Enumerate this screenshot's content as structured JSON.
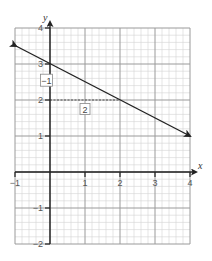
{
  "chart_data": {
    "type": "line",
    "title": "",
    "xlabel": "x",
    "ylabel": "y",
    "xlim": [
      -1,
      4
    ],
    "ylim": [
      -2,
      4
    ],
    "grid": true,
    "grid_minor_divisions": 5,
    "x_ticks": [
      -1,
      1,
      2,
      3,
      4
    ],
    "y_ticks": [
      4,
      3,
      2,
      1,
      -1,
      -2
    ],
    "x_tick_labels": [
      "-1",
      "1",
      "2",
      "3",
      "4"
    ],
    "y_tick_labels": [
      "4",
      "3",
      "2",
      "1",
      "-1",
      "-2"
    ],
    "series": [
      {
        "name": "line",
        "points": [
          [
            -1,
            3.5
          ],
          [
            0,
            3
          ],
          [
            2,
            2
          ],
          [
            4,
            1
          ]
        ],
        "slope": -0.5,
        "y_intercept": 3,
        "arrows": "both",
        "color": "#222222"
      }
    ],
    "annotations": [
      {
        "type": "dashed_segment",
        "from": [
          0,
          2
        ],
        "to": [
          2,
          2
        ],
        "description": "run from y-intercept level"
      },
      {
        "type": "boxed_label",
        "text": "-1",
        "position": [
          -0.1,
          2.55
        ],
        "meaning": "rise"
      },
      {
        "type": "boxed_label",
        "text": "2",
        "position": [
          1.0,
          1.75
        ],
        "meaning": "run"
      }
    ]
  },
  "axes": {
    "x_name": "x",
    "y_name": "y"
  },
  "labels": {
    "x_ticks": [
      {
        "value": -1,
        "text": "−1"
      },
      {
        "value": 1,
        "text": "1"
      },
      {
        "value": 2,
        "text": "2"
      },
      {
        "value": 3,
        "text": "3"
      },
      {
        "value": 4,
        "text": "4"
      }
    ],
    "y_ticks": [
      {
        "value": 4,
        "text": "4"
      },
      {
        "value": 3,
        "text": "3"
      },
      {
        "value": 2,
        "text": "2"
      },
      {
        "value": 1,
        "text": "1"
      },
      {
        "value": -1,
        "text": "−1"
      },
      {
        "value": -2,
        "text": "−2"
      }
    ],
    "rise_box": "−1",
    "run_box": "2"
  },
  "colors": {
    "minor_grid": "#d4d4d4",
    "major_grid": "#9a9a9a",
    "axis": "#222222",
    "line": "#222222",
    "text": "#555555"
  }
}
